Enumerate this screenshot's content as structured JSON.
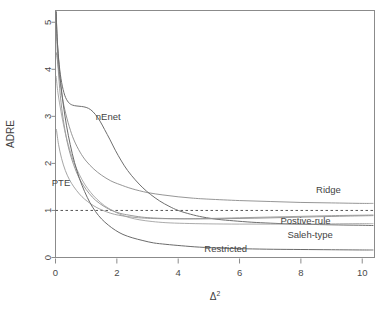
{
  "chart_data": {
    "type": "line",
    "title": "",
    "xlabel": "Δ²",
    "ylabel": "ADRE",
    "xlim": [
      0,
      10.4
    ],
    "ylim": [
      0,
      5.25
    ],
    "xticks": [
      "0",
      "2",
      "4",
      "6",
      "8",
      "10"
    ],
    "xtick_values": [
      0,
      2,
      4,
      6,
      8,
      10
    ],
    "yticks": [
      "0",
      "1",
      "2",
      "3",
      "4",
      "5"
    ],
    "ytick_values": [
      0,
      1,
      2,
      3,
      4,
      5
    ],
    "grid": false,
    "legend_position": "inline-annotations",
    "reference_line": {
      "name": "unit-efficiency-line",
      "orientation": "horizontal",
      "value": 1,
      "style": "dashed",
      "color": "#555555"
    },
    "series": [
      {
        "name": "Ridge",
        "label": "Ridge",
        "color": "#8a8a8a",
        "width": 0.9,
        "label_x": 8.9,
        "label_y": 1.38,
        "points": [
          [
            0.03,
            4.35
          ],
          [
            0.1,
            4.0
          ],
          [
            0.2,
            3.5
          ],
          [
            0.3,
            3.15
          ],
          [
            0.45,
            2.78
          ],
          [
            0.6,
            2.5
          ],
          [
            0.8,
            2.24
          ],
          [
            1.0,
            2.05
          ],
          [
            1.25,
            1.88
          ],
          [
            1.5,
            1.75
          ],
          [
            1.8,
            1.63
          ],
          [
            2.1,
            1.55
          ],
          [
            2.5,
            1.46
          ],
          [
            3.0,
            1.38
          ],
          [
            3.5,
            1.33
          ],
          [
            4.0,
            1.29
          ],
          [
            4.5,
            1.26
          ],
          [
            5.0,
            1.24
          ],
          [
            6.0,
            1.21
          ],
          [
            7.0,
            1.19
          ],
          [
            8.0,
            1.17
          ],
          [
            9.0,
            1.16
          ],
          [
            10.0,
            1.15
          ],
          [
            10.35,
            1.15
          ]
        ]
      },
      {
        "name": "nEnet",
        "label": "nEnet",
        "color": "#6e6e6e",
        "width": 1.0,
        "label_x": 1.72,
        "label_y": 2.93,
        "points": [
          [
            0.02,
            5.22
          ],
          [
            0.06,
            4.6
          ],
          [
            0.12,
            4.1
          ],
          [
            0.2,
            3.72
          ],
          [
            0.3,
            3.45
          ],
          [
            0.42,
            3.3
          ],
          [
            0.55,
            3.24
          ],
          [
            0.7,
            3.22
          ],
          [
            0.85,
            3.21
          ],
          [
            1.0,
            3.19
          ],
          [
            1.15,
            3.14
          ],
          [
            1.3,
            3.04
          ],
          [
            1.45,
            2.9
          ],
          [
            1.6,
            2.72
          ],
          [
            1.78,
            2.5
          ],
          [
            1.95,
            2.28
          ],
          [
            2.15,
            2.05
          ],
          [
            2.35,
            1.85
          ],
          [
            2.6,
            1.65
          ],
          [
            2.85,
            1.48
          ],
          [
            3.1,
            1.34
          ],
          [
            3.4,
            1.2
          ],
          [
            3.7,
            1.09
          ],
          [
            4.0,
            1.0
          ],
          [
            4.4,
            0.92
          ],
          [
            4.8,
            0.86
          ],
          [
            5.3,
            0.81
          ],
          [
            5.8,
            0.78
          ],
          [
            6.4,
            0.75
          ],
          [
            7.0,
            0.73
          ],
          [
            7.8,
            0.71
          ],
          [
            8.6,
            0.7
          ],
          [
            9.4,
            0.69
          ],
          [
            10.0,
            0.685
          ],
          [
            10.35,
            0.68
          ]
        ]
      },
      {
        "name": "PTE",
        "label": "PTE",
        "color": "#9b9b9b",
        "width": 0.9,
        "label_x": 0.18,
        "label_y": 1.52,
        "points": [
          [
            0.03,
            2.72
          ],
          [
            0.1,
            2.4
          ],
          [
            0.2,
            2.1
          ],
          [
            0.32,
            1.85
          ],
          [
            0.45,
            1.66
          ],
          [
            0.6,
            1.5
          ],
          [
            0.78,
            1.35
          ],
          [
            0.95,
            1.24
          ],
          [
            1.15,
            1.14
          ],
          [
            1.35,
            1.06
          ],
          [
            1.55,
            1.0
          ],
          [
            1.8,
            0.94
          ],
          [
            2.05,
            0.9
          ],
          [
            2.35,
            0.87
          ],
          [
            2.7,
            0.845
          ],
          [
            3.1,
            0.83
          ],
          [
            3.6,
            0.825
          ],
          [
            4.2,
            0.825
          ],
          [
            5.0,
            0.83
          ],
          [
            6.0,
            0.845
          ],
          [
            7.0,
            0.86
          ],
          [
            8.0,
            0.875
          ],
          [
            9.0,
            0.89
          ],
          [
            10.0,
            0.9
          ],
          [
            10.35,
            0.905
          ]
        ]
      },
      {
        "name": "Postive-rule",
        "label": "Postive-rule",
        "color": "#8f8f8f",
        "width": 0.9,
        "label_x": 8.15,
        "label_y": 0.72,
        "points": [
          [
            0.02,
            5.22
          ],
          [
            0.05,
            4.5
          ],
          [
            0.1,
            3.9
          ],
          [
            0.18,
            3.3
          ],
          [
            0.28,
            2.82
          ],
          [
            0.4,
            2.4
          ],
          [
            0.55,
            2.05
          ],
          [
            0.72,
            1.76
          ],
          [
            0.9,
            1.54
          ],
          [
            1.1,
            1.36
          ],
          [
            1.3,
            1.22
          ],
          [
            1.55,
            1.1
          ],
          [
            1.8,
            1.01
          ],
          [
            2.1,
            0.94
          ],
          [
            2.4,
            0.9
          ],
          [
            2.8,
            0.86
          ],
          [
            3.2,
            0.84
          ],
          [
            3.8,
            0.825
          ],
          [
            4.5,
            0.82
          ],
          [
            5.5,
            0.825
          ],
          [
            6.5,
            0.835
          ],
          [
            7.5,
            0.85
          ],
          [
            8.5,
            0.865
          ],
          [
            9.5,
            0.88
          ],
          [
            10.35,
            0.89
          ]
        ]
      },
      {
        "name": "Saleh-type",
        "label": "Saleh-type",
        "color": "#a2a2a2",
        "width": 0.9,
        "label_x": 8.3,
        "label_y": 0.42,
        "points": [
          [
            0.02,
            3.85
          ],
          [
            0.08,
            3.5
          ],
          [
            0.18,
            3.1
          ],
          [
            0.3,
            2.7
          ],
          [
            0.45,
            2.32
          ],
          [
            0.6,
            2.02
          ],
          [
            0.78,
            1.76
          ],
          [
            0.95,
            1.56
          ],
          [
            1.15,
            1.38
          ],
          [
            1.35,
            1.24
          ],
          [
            1.6,
            1.1
          ],
          [
            1.85,
            1.0
          ],
          [
            2.1,
            0.92
          ],
          [
            2.4,
            0.85
          ],
          [
            2.75,
            0.8
          ],
          [
            3.15,
            0.765
          ],
          [
            3.6,
            0.74
          ],
          [
            4.2,
            0.725
          ],
          [
            5.0,
            0.715
          ],
          [
            6.0,
            0.71
          ],
          [
            7.0,
            0.71
          ],
          [
            8.0,
            0.71
          ],
          [
            9.0,
            0.715
          ],
          [
            10.0,
            0.72
          ],
          [
            10.35,
            0.72
          ]
        ]
      },
      {
        "name": "Restricted",
        "label": "Restricted",
        "color": "#6b6b6b",
        "width": 1.0,
        "label_x": 5.55,
        "label_y": 0.12,
        "points": [
          [
            0.02,
            5.22
          ],
          [
            0.05,
            4.7
          ],
          [
            0.1,
            4.2
          ],
          [
            0.17,
            3.7
          ],
          [
            0.26,
            3.22
          ],
          [
            0.36,
            2.8
          ],
          [
            0.48,
            2.4
          ],
          [
            0.62,
            2.02
          ],
          [
            0.78,
            1.68
          ],
          [
            0.95,
            1.4
          ],
          [
            1.12,
            1.17
          ],
          [
            1.3,
            0.98
          ],
          [
            1.5,
            0.82
          ],
          [
            1.72,
            0.69
          ],
          [
            1.95,
            0.58
          ],
          [
            2.2,
            0.49
          ],
          [
            2.5,
            0.42
          ],
          [
            2.85,
            0.36
          ],
          [
            3.2,
            0.31
          ],
          [
            3.6,
            0.28
          ],
          [
            4.1,
            0.25
          ],
          [
            4.7,
            0.22
          ],
          [
            5.4,
            0.2
          ],
          [
            6.2,
            0.185
          ],
          [
            7.1,
            0.175
          ],
          [
            8.0,
            0.17
          ],
          [
            9.0,
            0.165
          ],
          [
            10.0,
            0.16
          ],
          [
            10.35,
            0.16
          ]
        ]
      }
    ]
  },
  "axes": {
    "y_title": "ADRE",
    "x_title_base": "Δ",
    "x_title_exponent": "2"
  }
}
